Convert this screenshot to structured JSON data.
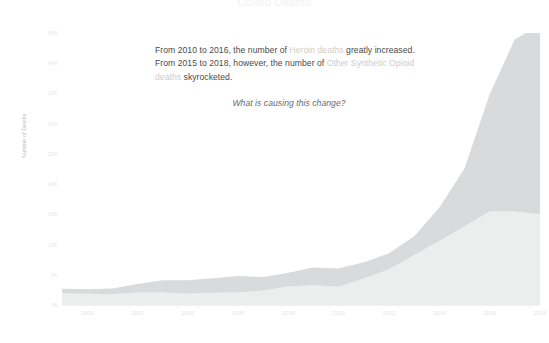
{
  "title": "Opioid Deaths",
  "annotation": {
    "line_1_a": "From 2010 to 2016, the number of ",
    "line_1_highlight": "Heroin deaths",
    "line_1_b": " greatly increased. From 2015 to 2018, however, the number of ",
    "line_2_highlight": "Other Synthetic Opioid deaths",
    "line_2_b": " skyrocketed.",
    "question": "What is causing this change?"
  },
  "colors": {
    "heroin_text": "#cfcec4",
    "synthetic_text": "#c9cdd2",
    "area_upper": "#d8dadb",
    "area_lower": "#eceded",
    "body_text": "#4a4a4a",
    "tick_text": "#e5e5e7",
    "axis_line": "#f1f1f2",
    "background": "#ffffff"
  },
  "chart_data": {
    "type": "area",
    "stacked": true,
    "title": "Opioid Deaths",
    "xlabel": "",
    "ylabel": "Number of Deaths",
    "xlim": [
      1999,
      2018
    ],
    "ylim": [
      0,
      45000
    ],
    "grid": false,
    "legend": "none",
    "x": [
      1999,
      2000,
      2001,
      2002,
      2003,
      2004,
      2005,
      2006,
      2007,
      2008,
      2009,
      2010,
      2011,
      2012,
      2013,
      2014,
      2015,
      2016,
      2017,
      2018
    ],
    "xticks": [
      2000,
      2002,
      2004,
      2006,
      2008,
      2010,
      2012,
      2014,
      2016,
      2018
    ],
    "xtick_labels": [
      "2000",
      "2002",
      "2004",
      "2006",
      "2008",
      "2010",
      "2012",
      "2014",
      "2016",
      "2018"
    ],
    "yticks": [
      0,
      5000,
      10000,
      15000,
      20000,
      25000,
      30000,
      35000,
      40000,
      45000
    ],
    "ytick_labels": [
      "0K",
      "5K",
      "10K",
      "15K",
      "20K",
      "25K",
      "30K",
      "35K",
      "40K",
      "45K"
    ],
    "series": [
      {
        "name": "Heroin deaths",
        "color": "#eceded",
        "order": "lower",
        "values": [
          1960,
          1842,
          1779,
          2080,
          2080,
          1878,
          2009,
          2088,
          2399,
          3041,
          3278,
          3036,
          4397,
          5925,
          8257,
          10574,
          12989,
          15469,
          15482,
          14996
        ]
      },
      {
        "name": "Other Synthetic Opioid deaths",
        "color": "#d8dadb",
        "order": "upper",
        "values": [
          730,
          782,
          957,
          1400,
          2000,
          2200,
          2400,
          2707,
          2213,
          2306,
          2946,
          3007,
          2666,
          2628,
          3105,
          5544,
          9580,
          19413,
          28466,
          31335
        ]
      }
    ]
  }
}
